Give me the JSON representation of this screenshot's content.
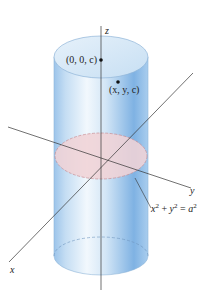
{
  "figure": {
    "colors": {
      "cylinder_light": "#e9f3fb",
      "cylinder_mid": "#bcd8f0",
      "cylinder_dark": "#7fb0e0",
      "top_face": "#d6e8f6",
      "cross_section": "#f0d6d8",
      "cross_section_edge": "#c98e94",
      "axis": "#333333"
    },
    "axes": {
      "x": "x",
      "y": "y",
      "z": "z"
    },
    "points": [
      {
        "label": "(0, 0, c)"
      },
      {
        "label": "(x, y, c)"
      }
    ],
    "equation": {
      "x": "x",
      "plus": " + ",
      "y": "y",
      "eq": " = ",
      "a": "a",
      "exp": "2"
    }
  }
}
